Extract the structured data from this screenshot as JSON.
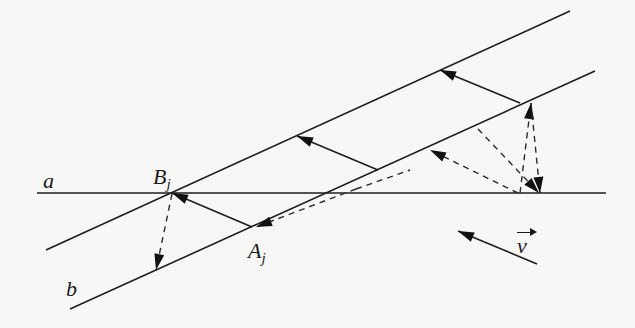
{
  "figure": {
    "width": 635,
    "height": 328,
    "background": "#f7f7f5",
    "stroke_color": "#1e1e1e"
  },
  "labels": {
    "line_a": "a",
    "line_b": "b",
    "point_B": "B",
    "point_B_sub": "j",
    "point_A": "A",
    "point_A_sub": "j",
    "vector_v": "v"
  },
  "lines": [
    {
      "name": "line-a-horizontal",
      "x1": 37,
      "y1": 193,
      "x2": 606,
      "y2": 193
    },
    {
      "name": "upper-slanted-line",
      "x1": 46,
      "y1": 250,
      "x2": 570,
      "y2": 11
    },
    {
      "name": "line-b-slanted",
      "x1": 70,
      "y1": 309,
      "x2": 595,
      "y2": 71
    }
  ],
  "solid_arrows": [
    {
      "name": "arrow-Aj-to-Bj",
      "x1": 252,
      "y1": 227,
      "x2": 172,
      "y2": 193
    },
    {
      "name": "arrow-middle-reflection",
      "x1": 378,
      "y1": 170,
      "x2": 297,
      "y2": 136
    },
    {
      "name": "arrow-right-reflection",
      "x1": 520,
      "y1": 103,
      "x2": 440,
      "y2": 70
    },
    {
      "name": "arrow-velocity-v",
      "x1": 537,
      "y1": 264,
      "x2": 458,
      "y2": 231
    }
  ],
  "dashed_arrows": [
    {
      "name": "dashed-Bj-down-to-b",
      "x1": 172,
      "y1": 194,
      "x2": 156,
      "y2": 270
    },
    {
      "name": "dashed-long-to-Aj",
      "x1": 356,
      "y1": 189,
      "x2": 256,
      "y2": 227
    },
    {
      "name": "dashed-P1-to-b",
      "x1": 518,
      "y1": 193,
      "x2": 430,
      "y2": 150
    },
    {
      "name": "dashed-P1-up",
      "x1": 520,
      "y1": 193,
      "x2": 531,
      "y2": 103
    },
    {
      "name": "dashed-diag-to-P2",
      "x1": 478,
      "y1": 129,
      "x2": 539,
      "y2": 193
    },
    {
      "name": "dashed-top-to-P2",
      "x1": 531,
      "y1": 103,
      "x2": 540,
      "y2": 193
    }
  ],
  "dashed_segments": [
    {
      "name": "dashed-extension-along-b",
      "x1": 356,
      "y1": 189,
      "x2": 410,
      "y2": 170
    }
  ]
}
